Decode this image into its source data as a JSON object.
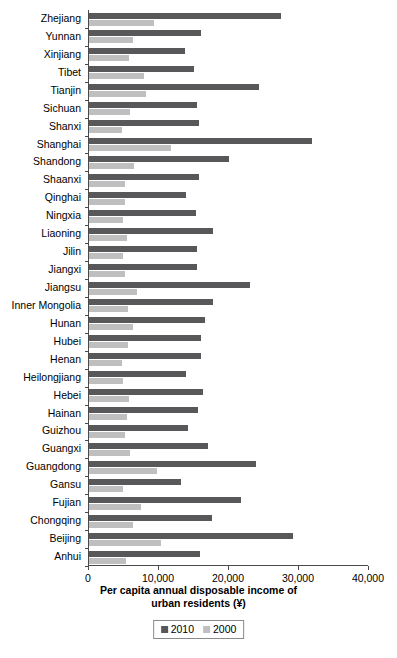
{
  "chart_data": {
    "type": "bar",
    "orientation": "horizontal",
    "title": "",
    "xlabel": "Per capita annual disposable income of urban residents (¥)",
    "xlabel_line1": "Per capita annual disposable income of",
    "xlabel_line2": "urban residents (¥)",
    "ylabel": "",
    "xlim": [
      0,
      40000
    ],
    "xticks": [
      0,
      10000,
      20000,
      30000,
      40000
    ],
    "xtick_labels": [
      "0",
      "10,000",
      "20,000",
      "30,000",
      "40,000"
    ],
    "grid": false,
    "legend_position": "bottom-center",
    "colors": {
      "2010": "#58585a",
      "2000": "#bfbfbf"
    },
    "legend": [
      "2010",
      "2000"
    ],
    "categories": [
      "Zhejiang",
      "Yunnan",
      "Xinjiang",
      "Tibet",
      "Tianjin",
      "Sichuan",
      "Shanxi",
      "Shanghai",
      "Shandong",
      "Shaanxi",
      "Qinghai",
      "Ningxia",
      "Liaoning",
      "Jilin",
      "Jiangxi",
      "Jiangsu",
      "Inner Mongolia",
      "Hunan",
      "Hubei",
      "Henan",
      "Heilongjiang",
      "Hebei",
      "Hainan",
      "Guizhou",
      "Guangxi",
      "Guangdong",
      "Gansu",
      "Fujian",
      "Chongqing",
      "Beijing",
      "Anhui"
    ],
    "series": [
      {
        "name": "2010",
        "values": [
          27359,
          16065,
          13644,
          14981,
          24293,
          15461,
          15648,
          31838,
          19946,
          15695,
          13855,
          15344,
          17713,
          15412,
          15481,
          22944,
          17698,
          16566,
          16058,
          15930,
          13857,
          16263,
          15581,
          14143,
          17064,
          23898,
          13188,
          21781,
          17532,
          29073,
          15788
        ]
      },
      {
        "name": "2000",
        "values": [
          9279,
          6325,
          5645,
          7869,
          8141,
          5894,
          4725,
          11718,
          6490,
          5124,
          5170,
          4912,
          5358,
          4810,
          5103,
          6800,
          5536,
          6219,
          5525,
          4766,
          4913,
          5661,
          5358,
          5122,
          5834,
          9762,
          4916,
          7432,
          6276,
          10350,
          5294
        ]
      }
    ]
  }
}
